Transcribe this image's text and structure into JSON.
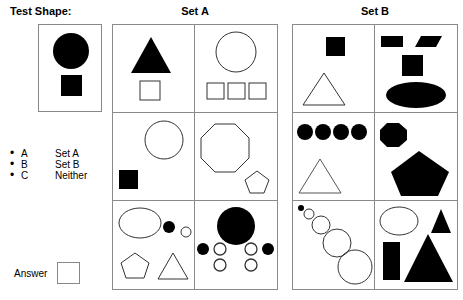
{
  "left_panel": {
    "test_shape_title": "Test Shape:",
    "test_shape": {
      "shapes": [
        {
          "kind": "circle",
          "fill": "solid",
          "color": "#000000"
        },
        {
          "kind": "square",
          "fill": "solid",
          "color": "#000000"
        }
      ]
    },
    "legend": [
      {
        "bullet": "•",
        "key": "A",
        "value": "Set A"
      },
      {
        "bullet": "•",
        "key": "B",
        "value": "Set B"
      },
      {
        "bullet": "•",
        "key": "C",
        "value": "Neither"
      }
    ],
    "answer_label": "Answer",
    "answer_value": "",
    "answer_placeholder": ""
  },
  "sets": [
    {
      "title": "Set A",
      "cells": [
        {
          "position": "row1-left",
          "shapes": [
            "filled triangle",
            "outlined square"
          ]
        },
        {
          "position": "row1-right",
          "shapes": [
            "outlined circle",
            "outlined square",
            "outlined square",
            "outlined square"
          ]
        },
        {
          "position": "row2-left",
          "shapes": [
            "outlined circle",
            "filled square"
          ]
        },
        {
          "position": "row2-right",
          "shapes": [
            "outlined octagon",
            "outlined pentagon"
          ]
        },
        {
          "position": "row3-left",
          "shapes": [
            "outlined ellipse",
            "filled small circle",
            "outlined small circle",
            "outlined pentagon",
            "outlined triangle"
          ]
        },
        {
          "position": "row3-right",
          "shapes": [
            "large filled circle",
            "filled small circle",
            "outlined small circle",
            "outlined small circle",
            "filled small circle",
            "outlined small circle",
            "outlined small circle"
          ]
        }
      ]
    },
    {
      "title": "Set B",
      "cells": [
        {
          "position": "row1-left",
          "shapes": [
            "filled square",
            "outlined triangle"
          ]
        },
        {
          "position": "row1-right",
          "shapes": [
            "filled rectangle",
            "filled parallelogram",
            "filled square",
            "filled ellipse"
          ]
        },
        {
          "position": "row2-left",
          "shapes": [
            "filled circle",
            "filled circle",
            "filled circle",
            "filled circle",
            "outlined triangle"
          ]
        },
        {
          "position": "row2-right",
          "shapes": [
            "filled octagon",
            "large filled pentagon"
          ]
        },
        {
          "position": "row3-left",
          "shapes": [
            "tiny filled circle",
            "outlined circle",
            "outlined circle",
            "outlined circle",
            "outlined circle"
          ]
        },
        {
          "position": "row3-right",
          "shapes": [
            "outlined ellipse",
            "small filled triangle",
            "filled rectangle",
            "large filled triangle"
          ]
        }
      ]
    }
  ],
  "colors": {
    "solid": "#000000",
    "outline": "#333333",
    "border": "#8a8a8a",
    "background": "#ffffff"
  }
}
